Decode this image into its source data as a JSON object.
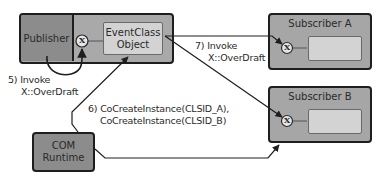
{
  "diagram": {
    "publisher": {
      "label": "Publisher",
      "fill": "#8c8c8c",
      "container_fill": "#a9a9a9"
    },
    "event_class": {
      "line1": "EventClass",
      "line2": "Object",
      "fill": "#d3d3d3"
    },
    "interface_glyph": "X",
    "subscriber_a": {
      "label": "Subscriber A",
      "fill": "#a6a6a6",
      "inner_fill": "#d3d3d3"
    },
    "subscriber_b": {
      "label": "Subscriber B",
      "fill": "#a6a6a6",
      "inner_fill": "#d3d3d3"
    },
    "com_runtime": {
      "line1": "COM",
      "line2": "Runtime",
      "fill": "#8c8c8c"
    },
    "steps": {
      "step5": {
        "line1": "5) Invoke",
        "line2": "X::OverDraft"
      },
      "step6": {
        "line1": "6) CoCreateInstance(CLSID_A),",
        "line2": "CoCreateInstance(CLSID_B)"
      },
      "step7": {
        "line1": "7) Invoke",
        "line2": "X::OverDraft"
      }
    },
    "line_color": "#1e1e1e"
  }
}
